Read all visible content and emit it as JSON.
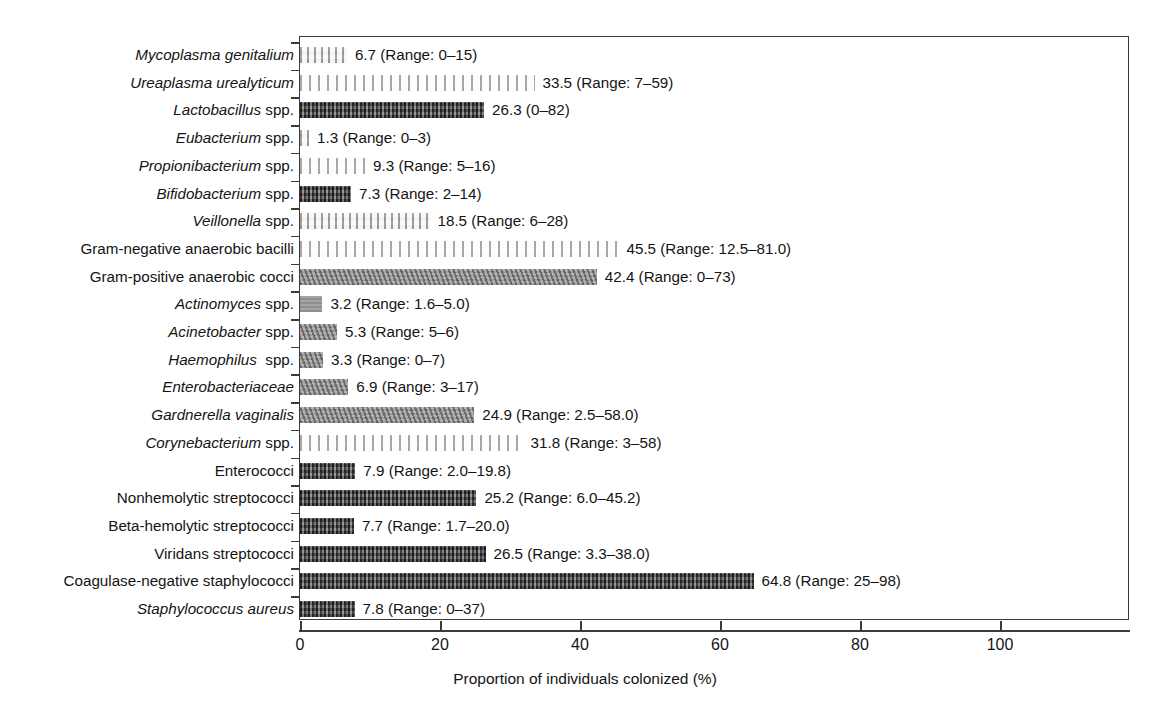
{
  "chart_data": {
    "type": "bar",
    "orientation": "horizontal",
    "title": "",
    "xlabel": "Proportion of individuals colonized (%)",
    "ylabel": "",
    "xlim": [
      0,
      118
    ],
    "xticks": [
      0,
      20,
      40,
      60,
      80,
      100
    ],
    "grid": false,
    "legend": null,
    "categories": [
      "Mycoplasma genitalium",
      "Ureaplasma urealyticum",
      "Lactobacillus spp.",
      "Eubacterium spp.",
      "Propionibacterium spp.",
      "Bifidobacterium spp.",
      "Veillonella spp.",
      "Gram-negative anaerobic bacilli",
      "Gram-positive anaerobic cocci",
      "Actinomyces spp.",
      "Acinetobacter spp.",
      "Haemophilus  spp.",
      "Enterobacteriaceae",
      "Gardnerella vaginalis",
      "Corynebacterium spp.",
      "Enterococci",
      "Nonhemolytic streptococci",
      "Beta-hemolytic streptococci",
      "Viridans streptococci",
      "Coagulase-negative staphylococci",
      "Staphylococcus aureus"
    ],
    "values": [
      6.7,
      33.5,
      26.3,
      1.3,
      9.3,
      7.3,
      18.5,
      45.5,
      42.4,
      3.2,
      5.3,
      3.3,
      6.9,
      24.9,
      31.8,
      7.9,
      25.2,
      7.7,
      26.5,
      64.8,
      7.8
    ],
    "annotations": [
      "6.7 (Range: 0–15)",
      "33.5 (Range: 7–59)",
      "26.3 (0–82)",
      "1.3 (Range: 0–3)",
      "9.3 (Range: 5–16)",
      "7.3 (Range: 2–14)",
      "18.5 (Range: 6–28)",
      "45.5 (Range: 12.5–81.0)",
      "42.4 (Range: 0–73)",
      "3.2 (Range: 1.6–5.0)",
      "5.3 (Range: 5–6)",
      "3.3 (Range: 0–7)",
      "6.9 (Range: 3–17)",
      "24.9 (Range: 2.5–58.0)",
      "31.8 (Range: 3–58)",
      "7.9 (Range: 2.0–19.8)",
      "25.2 (Range: 6.0–45.2)",
      "7.7 (Range: 1.7–20.0)",
      "26.5 (Range: 3.3–38.0)",
      "64.8 (Range: 25–98)",
      "7.8 (Range: 0–37)"
    ]
  },
  "rows": [
    {
      "label_italic": "Mycoplasma genitalium",
      "label_plain": "",
      "value": 6.7,
      "annotation": "6.7 (Range: 0–15)",
      "pattern": "pat-light"
    },
    {
      "label_italic": "Ureaplasma urealyticum",
      "label_plain": "",
      "value": 33.5,
      "annotation": "33.5 (Range: 7–59)",
      "pattern": "pat-vlight"
    },
    {
      "label_italic": "Lactobacillus",
      "label_plain": " spp.",
      "value": 26.3,
      "annotation": "26.3 (0–82)",
      "pattern": "pat-dark"
    },
    {
      "label_italic": "Eubacterium",
      "label_plain": " spp.",
      "value": 1.3,
      "annotation": "1.3 (Range: 0–3)",
      "pattern": "pat-light"
    },
    {
      "label_italic": "Propionibacterium",
      "label_plain": " spp.",
      "value": 9.3,
      "annotation": "9.3 (Range: 5–16)",
      "pattern": "pat-vlight"
    },
    {
      "label_italic": "Bifidobacterium",
      "label_plain": " spp.",
      "value": 7.3,
      "annotation": "7.3 (Range: 2–14)",
      "pattern": "pat-dark"
    },
    {
      "label_italic": "Veillonella",
      "label_plain": " spp.",
      "value": 18.5,
      "annotation": "18.5 (Range: 6–28)",
      "pattern": "pat-light"
    },
    {
      "label_italic": "",
      "label_plain": "Gram-negative anaerobic bacilli",
      "value": 45.5,
      "annotation": "45.5 (Range: 12.5–81.0)",
      "pattern": "pat-vlight"
    },
    {
      "label_italic": "",
      "label_plain": "Gram-positive anaerobic cocci",
      "value": 42.4,
      "annotation": "42.4 (Range: 0–73)",
      "pattern": "pat-mid"
    },
    {
      "label_italic": "Actinomyces",
      "label_plain": " spp.",
      "value": 3.2,
      "annotation": "3.2 (Range: 1.6–5.0)",
      "pattern": "pat-plain"
    },
    {
      "label_italic": "Acinetobacter",
      "label_plain": " spp.",
      "value": 5.3,
      "annotation": "5.3 (Range: 5–6)",
      "pattern": "pat-mid"
    },
    {
      "label_italic": "Haemophilus",
      "label_plain": "  spp.",
      "value": 3.3,
      "annotation": "3.3 (Range: 0–7)",
      "pattern": "pat-mid"
    },
    {
      "label_italic": "Enterobacteriaceae",
      "label_plain": "",
      "value": 6.9,
      "annotation": "6.9 (Range: 3–17)",
      "pattern": "pat-mid"
    },
    {
      "label_italic": "Gardnerella vaginalis",
      "label_plain": "",
      "value": 24.9,
      "annotation": "24.9 (Range: 2.5–58.0)",
      "pattern": "pat-mid"
    },
    {
      "label_italic": "Corynebacterium",
      "label_plain": " spp.",
      "value": 31.8,
      "annotation": "31.8 (Range: 3–58)",
      "pattern": "pat-vlight"
    },
    {
      "label_italic": "",
      "label_plain": "Enterococci",
      "value": 7.9,
      "annotation": "7.9 (Range: 2.0–19.8)",
      "pattern": "pat-dark"
    },
    {
      "label_italic": "",
      "label_plain": "Nonhemolytic streptococci",
      "value": 25.2,
      "annotation": "25.2 (Range: 6.0–45.2)",
      "pattern": "pat-dark"
    },
    {
      "label_italic": "",
      "label_plain": "Beta-hemolytic streptococci",
      "value": 7.7,
      "annotation": "7.7 (Range: 1.7–20.0)",
      "pattern": "pat-dark"
    },
    {
      "label_italic": "",
      "label_plain": "Viridans streptococci",
      "value": 26.5,
      "annotation": "26.5 (Range: 3.3–38.0)",
      "pattern": "pat-dark"
    },
    {
      "label_italic": "",
      "label_plain": "Coagulase-negative staphylococci",
      "value": 64.8,
      "annotation": "64.8 (Range: 25–98)",
      "pattern": "pat-dark"
    },
    {
      "label_italic": "Staphylococcus aureus",
      "label_plain": "",
      "value": 7.8,
      "annotation": "7.8 (Range: 0–37)",
      "pattern": "pat-dark"
    }
  ],
  "axis": {
    "ticks": [
      "0",
      "20",
      "40",
      "60",
      "80",
      "100"
    ],
    "tick_values": [
      0,
      20,
      40,
      60,
      80,
      100
    ],
    "title": "Proportion of individuals colonized (%)"
  },
  "colors": {
    "axis": "#3b3b3b",
    "text": "#141414",
    "bar_dark": "#4a4a4a",
    "bar_mid": "#8b8b8b",
    "bar_light": "#c9c9c9",
    "bar_vlight": "#e4e4e4"
  }
}
